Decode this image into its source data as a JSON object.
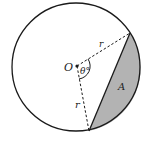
{
  "diagram": {
    "type": "circle-segment",
    "labels": {
      "center": "O",
      "angle": "θ°",
      "radius_upper": "r",
      "radius_lower": "r",
      "segment": "A"
    },
    "colors": {
      "stroke": "#1a1a1a",
      "segment_fill": "#b3b3b3",
      "background": "#ffffff"
    }
  }
}
